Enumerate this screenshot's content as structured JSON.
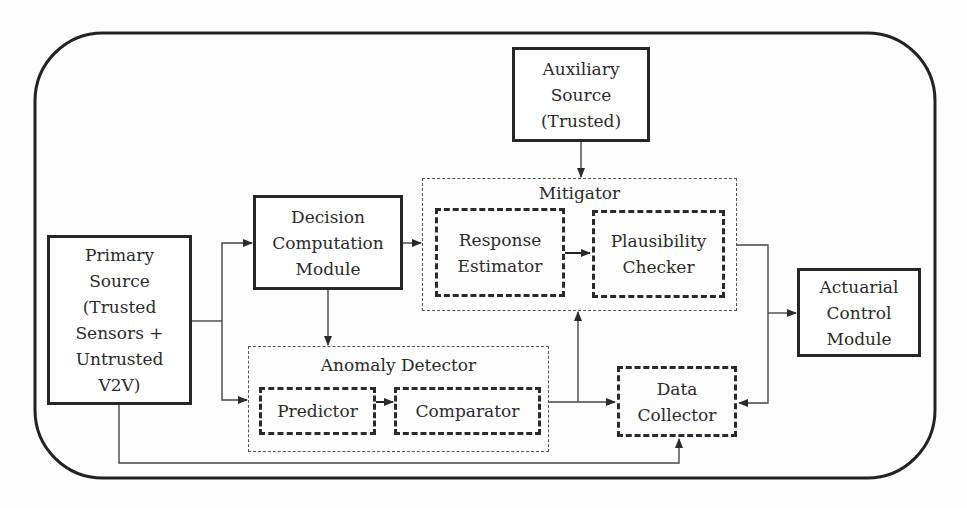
{
  "diagram": {
    "nodes": {
      "primary_source": {
        "label": "Primary\nSource\n(Trusted\nSensors +\nUntrusted\nV2V)"
      },
      "decision_module": {
        "label": "Decision\nComputation\nModule"
      },
      "auxiliary_source": {
        "label": "Auxiliary\nSource\n(Trusted)"
      },
      "mitigator": {
        "title": "Mitigator"
      },
      "response_estimator": {
        "label": "Response\nEstimator"
      },
      "plausibility_checker": {
        "label": "Plausibility\nChecker"
      },
      "anomaly_detector": {
        "title": "Anomaly Detector"
      },
      "predictor": {
        "label": "Predictor"
      },
      "comparator": {
        "label": "Comparator"
      },
      "data_collector": {
        "label": "Data\nCollector"
      },
      "actuarial_module": {
        "label": "Actuarial\nControl\nModule"
      }
    },
    "edges": [
      {
        "from": "primary_source",
        "to": "decision_module"
      },
      {
        "from": "primary_source",
        "to": "anomaly_detector"
      },
      {
        "from": "primary_source",
        "to": "data_collector"
      },
      {
        "from": "decision_module",
        "to": "mitigator"
      },
      {
        "from": "decision_module",
        "to": "anomaly_detector"
      },
      {
        "from": "auxiliary_source",
        "to": "mitigator"
      },
      {
        "from": "response_estimator",
        "to": "plausibility_checker"
      },
      {
        "from": "predictor",
        "to": "comparator"
      },
      {
        "from": "anomaly_detector",
        "to": "mitigator"
      },
      {
        "from": "anomaly_detector",
        "to": "data_collector"
      },
      {
        "from": "mitigator",
        "to": "actuarial_module"
      },
      {
        "from": "mitigator",
        "to": "data_collector"
      }
    ]
  }
}
